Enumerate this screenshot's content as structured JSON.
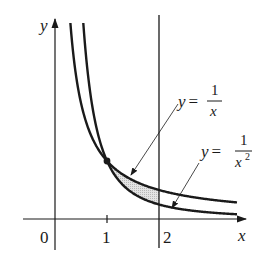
{
  "figure": {
    "axes": {
      "x_label": "x",
      "y_label": "y",
      "origin_label": "0",
      "x_ticks": [
        "1",
        "2"
      ]
    },
    "curves": [
      {
        "name": "reciprocal",
        "equation_lhs": "y =",
        "numerator": "1",
        "denominator": "x",
        "exponent": ""
      },
      {
        "name": "reciprocal-squared",
        "equation_lhs": "y =",
        "numerator": "1",
        "denominator": "x",
        "exponent": "2"
      }
    ],
    "vertical_line": {
      "x": 2
    },
    "intersection_point": {
      "x": 1,
      "y": 1
    },
    "shaded_region": {
      "from_x": 1,
      "to_x": 2,
      "between": [
        "1/x",
        "1/x^2"
      ]
    },
    "colors": {
      "ink": "#1a1a1a",
      "shade": "#d9d9d9"
    }
  }
}
